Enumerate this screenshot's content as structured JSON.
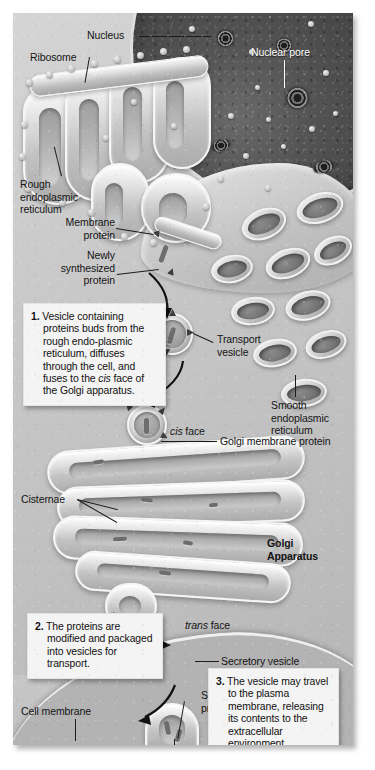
{
  "labels": {
    "nucleus": "Nucleus",
    "nuclear_pore": "Nuclear pore",
    "ribosome": "Ribosome",
    "rough_er": "Rough\nendoplasmic\nreticulum",
    "smooth_er": "Smooth\nendoplasmic\nreticulum",
    "membrane_protein": "Membrane\nprotein",
    "newly_synthesized_protein": "Newly\nsynthesized\nprotein",
    "transport_vesicle": "Transport\nvesicle",
    "cis_face_italic": "cis",
    "cis_face_rest": " face",
    "trans_face_italic": "trans",
    "trans_face_rest": " face",
    "golgi_membrane_protein": "Golgi membrane protein",
    "cisternae": "Cisternae",
    "golgi_apparatus": "Golgi\nApparatus",
    "secretory_vesicle": "Secretory vesicle",
    "secreted_protein": "Secreted\nprotein",
    "cell_membrane": "Cell membrane",
    "extracellular_fluid": "Extracellular fluid"
  },
  "steps": [
    {
      "number": "1.",
      "text_before_italic": " Vesicle containing proteins buds from the rough endo-plasmic reticulum, diffuses through the cell, and fuses to the ",
      "italic_word": "cis",
      "text_after_italic": " face of the Golgi apparatus."
    },
    {
      "number": "2.",
      "text": " The proteins are modified and packaged into vesicles for transport."
    },
    {
      "number": "3.",
      "text": " The vesicle may travel to the plasma membrane, releasing its contents to the extracellular environment."
    }
  ],
  "colors": {
    "cytoplasm": "#c6c6c6",
    "nucleus": "#3a3a3a",
    "membrane_highlight": "#f6f6f6",
    "caption_box": "#f4f4f4",
    "text": "#141414",
    "light_text": "#ffffff"
  }
}
